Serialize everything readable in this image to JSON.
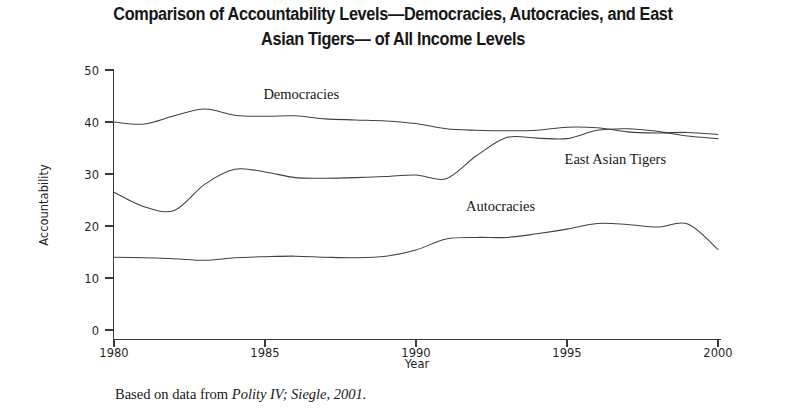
{
  "figure": {
    "title": "Comparison of Accountability Levels—Democracies, Autocracies, and East\nAsian Tigers— of All Income Levels",
    "caption_prefix": "Based on data from ",
    "caption_source": "Polity IV; Siegle, 2001."
  },
  "axes": {
    "y_label": "Accountability",
    "x_label": "Year",
    "y_ticks": [
      "0",
      "10",
      "20",
      "30",
      "40",
      "50"
    ],
    "x_ticks": [
      "1980",
      "1985",
      "1990",
      "1995",
      "2000"
    ]
  },
  "series_labels": {
    "democracies": "Democracies",
    "east_asian_tigers": "East Asian Tigers",
    "autocracies": "Autocracies"
  },
  "colors": {
    "line": "#404040",
    "axis": "#3a3a3a",
    "text": "#1a1a1a",
    "background": "#ffffff"
  },
  "chart_data": {
    "type": "line",
    "title": "Comparison of Accountability Levels—Democracies, Autocracies, and East Asian Tigers— of All Income Levels",
    "xlabel": "Year",
    "ylabel": "Accountability",
    "xlim": [
      1980,
      2000
    ],
    "ylim": [
      0,
      50
    ],
    "x_tick_values": [
      1980,
      1985,
      1990,
      1995,
      2000
    ],
    "y_tick_values": [
      0,
      10,
      20,
      30,
      40,
      50
    ],
    "grid": false,
    "legend": "inline-labels",
    "source_note": "Based on data from Polity IV; Siegle, 2001.",
    "x": [
      1980,
      1981,
      1982,
      1983,
      1984,
      1985,
      1986,
      1987,
      1988,
      1989,
      1990,
      1991,
      1992,
      1993,
      1994,
      1995,
      1996,
      1997,
      1998,
      1999,
      2000
    ],
    "series": [
      {
        "name": "Democracies",
        "label_position": {
          "x": 1986.2,
          "y": 44.5
        },
        "values": [
          40.0,
          39.6,
          41.2,
          42.5,
          41.3,
          41.1,
          41.2,
          40.6,
          40.4,
          40.2,
          39.7,
          38.7,
          38.4,
          38.3,
          38.4,
          39.0,
          38.9,
          38.1,
          37.9,
          38.0,
          37.6
        ]
      },
      {
        "name": "East Asian Tigers",
        "label_position": {
          "x": 1996.6,
          "y": 32.0
        },
        "values": [
          26.5,
          23.7,
          23.0,
          28.0,
          30.9,
          30.4,
          29.3,
          29.2,
          29.3,
          29.5,
          29.8,
          29.1,
          33.5,
          37.0,
          36.9,
          36.8,
          38.4,
          38.7,
          38.2,
          37.3,
          36.8
        ]
      },
      {
        "name": "Autocracies",
        "label_position": {
          "x": 1992.8,
          "y": 22.8
        },
        "values": [
          14.0,
          13.9,
          13.7,
          13.4,
          13.9,
          14.1,
          14.2,
          14.0,
          13.9,
          14.2,
          15.4,
          17.5,
          17.8,
          17.8,
          18.5,
          19.4,
          20.5,
          20.3,
          19.8,
          20.4,
          15.5
        ]
      }
    ]
  }
}
